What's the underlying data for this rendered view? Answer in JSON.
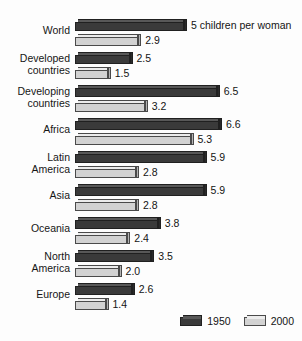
{
  "chart_data": {
    "type": "bar",
    "orientation": "horizontal",
    "title": "",
    "subtitle": "",
    "xlabel": "",
    "ylabel": "",
    "xlim": [
      0,
      7
    ],
    "grid": false,
    "legend_position": "bottom-right",
    "categories": [
      "World",
      "Developed countries",
      "Developing countries",
      "Africa",
      "Latin America",
      "Asia",
      "Oceania",
      "North America",
      "Europe"
    ],
    "series": [
      {
        "name": "1950",
        "color": "#3a3a3a",
        "values": [
          5.0,
          2.5,
          6.5,
          6.6,
          5.9,
          5.9,
          3.8,
          3.5,
          2.6
        ]
      },
      {
        "name": "2000",
        "color": "#d2d2d2",
        "values": [
          2.9,
          1.5,
          3.2,
          5.3,
          2.8,
          2.8,
          2.4,
          2.0,
          1.4
        ]
      }
    ],
    "annotations": [
      {
        "category": "World",
        "series": "1950",
        "text": "5 children per woman"
      }
    ],
    "units": "children per woman"
  },
  "rows": [
    {
      "label_lines": [
        "World"
      ],
      "s1": {
        "value": 5.0,
        "label": "5 children per woman"
      },
      "s2": {
        "value": 2.9,
        "label": "2.9"
      }
    },
    {
      "label_lines": [
        "Developed",
        "countries"
      ],
      "s1": {
        "value": 2.5,
        "label": "2.5"
      },
      "s2": {
        "value": 1.5,
        "label": "1.5"
      }
    },
    {
      "label_lines": [
        "Developing",
        "countries"
      ],
      "s1": {
        "value": 6.5,
        "label": "6.5"
      },
      "s2": {
        "value": 3.2,
        "label": "3.2"
      }
    },
    {
      "label_lines": [
        "Africa"
      ],
      "s1": {
        "value": 6.6,
        "label": "6.6"
      },
      "s2": {
        "value": 5.3,
        "label": "5.3"
      }
    },
    {
      "label_lines": [
        "Latin",
        "America"
      ],
      "s1": {
        "value": 5.9,
        "label": "5.9"
      },
      "s2": {
        "value": 2.8,
        "label": "2.8"
      }
    },
    {
      "label_lines": [
        "Asia"
      ],
      "s1": {
        "value": 5.9,
        "label": "5.9"
      },
      "s2": {
        "value": 2.8,
        "label": "2.8"
      }
    },
    {
      "label_lines": [
        "Oceania"
      ],
      "s1": {
        "value": 3.8,
        "label": "3.8"
      },
      "s2": {
        "value": 2.4,
        "label": "2.4"
      }
    },
    {
      "label_lines": [
        "North",
        "America"
      ],
      "s1": {
        "value": 3.5,
        "label": "3.5"
      },
      "s2": {
        "value": 2.0,
        "label": "2.0"
      }
    },
    {
      "label_lines": [
        "Europe"
      ],
      "s1": {
        "value": 2.6,
        "label": "2.6"
      },
      "s2": {
        "value": 1.4,
        "label": "1.4"
      }
    }
  ],
  "legend": {
    "items": [
      {
        "label": "1950",
        "swatch": "dark"
      },
      {
        "label": "2000",
        "swatch": "light"
      }
    ]
  },
  "scale": {
    "px_per_unit": 21.8,
    "origin_x": 75
  }
}
